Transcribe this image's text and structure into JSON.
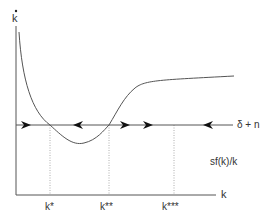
{
  "diagram": {
    "y_axis_label": "k̇",
    "x_axis_label": "k",
    "line_label": "δ + n",
    "curve_label": "sf(k)/k",
    "steady_states": [
      "k*",
      "k**",
      "k***"
    ],
    "colors": {
      "axis": "#555555",
      "curve": "#555555",
      "arrow": "#111111",
      "guide": "#999999"
    }
  }
}
